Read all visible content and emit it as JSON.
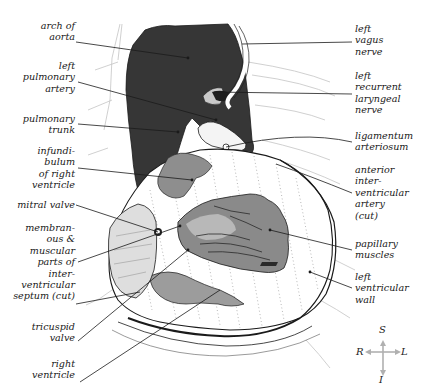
{
  "figure": {
    "colors": {
      "background": "#ffffff",
      "great_vessels": "#353535",
      "muscle_gray": "#8c8c8c",
      "light_gray": "#b5b5b5",
      "line": "#1a1a1a",
      "faint_line": "#bdbdbd",
      "compass": "#b0b0b0"
    }
  },
  "labels_left": [
    {
      "id": "arch-of-aorta",
      "text": "arch of\naorta"
    },
    {
      "id": "left-pulmonary-artery",
      "text": "left\npulmonary\nartery"
    },
    {
      "id": "pulmonary-trunk",
      "text": "pulmonary\ntrunk"
    },
    {
      "id": "infundibulum",
      "text": "infundi-\nbulum\nof right\nventricle"
    },
    {
      "id": "mitral-valve",
      "text": "mitral valve"
    },
    {
      "id": "septum",
      "text": "membran-\nous &\nmuscular\nparts of\ninter-\nventricular\nseptum (cut)"
    },
    {
      "id": "tricuspid-valve",
      "text": "tricuspid\nvalve"
    },
    {
      "id": "right-ventricle",
      "text": "right\nventricle"
    }
  ],
  "labels_right": [
    {
      "id": "left-vagus-nerve",
      "text": "left\nvagus\nnerve"
    },
    {
      "id": "left-recurrent-laryngeal-nerve",
      "text": "left\nrecurrent\nlaryngeal\nnerve"
    },
    {
      "id": "ligamentum-arteriosum",
      "text": "ligamentum\narteriosum"
    },
    {
      "id": "anterior-interventricular-artery",
      "text": "anterior\ninter-\nventricular\nartery\n(cut)"
    },
    {
      "id": "papillary-muscles",
      "text": "papillary\nmuscles"
    },
    {
      "id": "left-ventricular-wall",
      "text": "left\nventricular\nwall"
    }
  ],
  "compass": {
    "superior": "S",
    "inferior": "I",
    "right": "R",
    "left": "L"
  }
}
